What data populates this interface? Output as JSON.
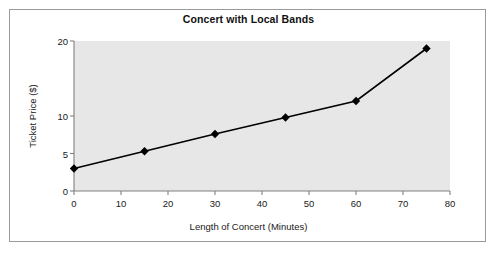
{
  "chart_data": {
    "type": "line",
    "title": "Concert with Local Bands",
    "xlabel": "Length of Concert (Minutes)",
    "ylabel": "Ticket Price ($)",
    "x": [
      0,
      15,
      30,
      45,
      60,
      75
    ],
    "values": [
      3,
      5.3,
      7.6,
      9.8,
      12,
      19
    ],
    "series": [
      {
        "name": "Ticket Price",
        "x": [
          0,
          15,
          30,
          45,
          60,
          75
        ],
        "values": [
          3,
          5.3,
          7.6,
          9.8,
          12,
          19
        ]
      }
    ],
    "xlim": [
      0,
      80
    ],
    "ylim": [
      0,
      20
    ],
    "xticks": [
      0,
      10,
      20,
      30,
      40,
      50,
      60,
      70,
      80
    ],
    "xticklabels": [
      "0",
      "10",
      "20",
      "30",
      "40",
      "50",
      "60",
      "70",
      "80"
    ],
    "yticks": [
      0,
      5,
      10,
      20
    ],
    "yticklabels": [
      "0",
      "5",
      "10",
      "20"
    ],
    "grid": false,
    "legend": false,
    "marker": "diamond",
    "colors": {
      "line": "#000000",
      "marker": "#000000",
      "plot_background": "#e7e7e7",
      "axis": "#808080",
      "figure_background": "#ffffff",
      "frame_border": "#9a9a9a",
      "text": "#1a1a1a"
    }
  }
}
